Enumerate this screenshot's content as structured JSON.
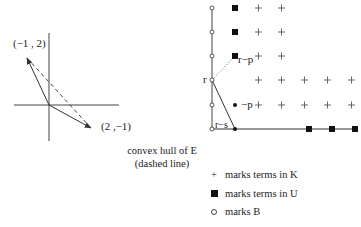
{
  "left_figure": {
    "label_vec1": "(−1 , 2)",
    "label_vec2": "(2 ,−1)",
    "caption_line1": "convex hull of E",
    "caption_line2": "(dashed line)",
    "vectors": [
      [
        -1,
        2
      ],
      [
        2,
        -1
      ]
    ]
  },
  "right_figure": {
    "label_r": "r",
    "label_r_minus_p": "r−p",
    "label_minus_p": "−p",
    "label_r_minus_s": "r−s",
    "B_points": [
      [
        0,
        0
      ],
      [
        0,
        1
      ],
      [
        0,
        2
      ],
      [
        0,
        3
      ],
      [
        0,
        4
      ],
      [
        0,
        5
      ]
    ],
    "U_points": [
      [
        1,
        5
      ],
      [
        1,
        4
      ],
      [
        1,
        3
      ],
      [
        4,
        0
      ],
      [
        5,
        0
      ],
      [
        6,
        0
      ]
    ],
    "K_points": [
      [
        2,
        5
      ],
      [
        3,
        5
      ],
      [
        2,
        4
      ],
      [
        3,
        4
      ],
      [
        2,
        3
      ],
      [
        3,
        3
      ],
      [
        2,
        2
      ],
      [
        3,
        2
      ],
      [
        4,
        2
      ],
      [
        5,
        2
      ],
      [
        6,
        2
      ],
      [
        2,
        1
      ],
      [
        3,
        1
      ],
      [
        4,
        1
      ],
      [
        5,
        1
      ],
      [
        6,
        1
      ]
    ],
    "dot_points": [
      [
        1,
        1
      ],
      [
        1,
        0
      ]
    ]
  },
  "legend": {
    "items": [
      {
        "symbol": "+",
        "label": "marks terms in K"
      },
      {
        "symbol": "square",
        "label": "marks terms in U"
      },
      {
        "symbol": "circle",
        "label": "marks B"
      }
    ]
  },
  "colors": {
    "ink": "#222222",
    "background": "#ffffff"
  }
}
